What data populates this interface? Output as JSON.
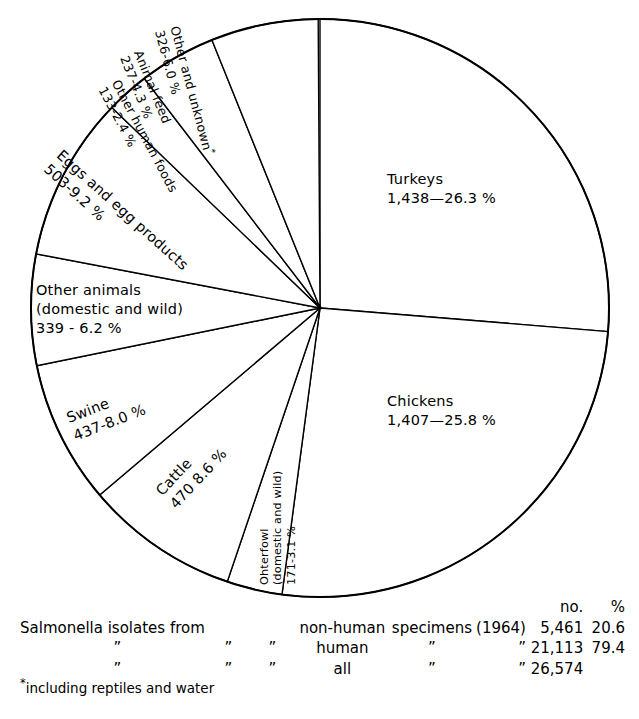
{
  "chart_data": {
    "type": "pie",
    "title": "",
    "start_angle_deg": 0,
    "direction": "clockwise",
    "total_no": 5461,
    "units": "isolates",
    "categories": [
      "Turkeys",
      "Chickens",
      "Ohterfowl (domestic and wild)",
      "Cattle",
      "Swine",
      "Other animals (domestic and wild)",
      "Eggs and egg products",
      "Other human foods",
      "Animal feed",
      "Other and unknown"
    ],
    "values": [
      26.3,
      25.8,
      3.1,
      8.6,
      8.0,
      6.2,
      9.2,
      2.4,
      4.3,
      6.0
    ],
    "counts": [
      1438,
      1407,
      171,
      470,
      437,
      339,
      503,
      133,
      237,
      326
    ],
    "slices": [
      {
        "name": "Turkeys",
        "label_l1": "Turkeys",
        "label_l2": "1,438—26.3 %",
        "count": "1,438",
        "percent": "26.3 %",
        "value": 26.3
      },
      {
        "name": "Chickens",
        "label_l1": "Chickens",
        "label_l2": "1,407—25.8 %",
        "count": "1,407",
        "percent": "25.8 %",
        "value": 25.8
      },
      {
        "name": "Other fowl",
        "label_l1": "Ohterfowl",
        "label_l2": "(domestic and wild)",
        "label_l3": "171—3.1 %",
        "count": "171",
        "percent": "3.1 %",
        "value": 3.1
      },
      {
        "name": "Cattle",
        "label_l1": "Cattle",
        "label_l2": "470  8.6 %",
        "count": "470",
        "percent": "8.6 %",
        "value": 8.6
      },
      {
        "name": "Swine",
        "label_l1": "Swine",
        "label_l2": "437-8.0 %",
        "count": "437",
        "percent": "8.0 %",
        "value": 8.0
      },
      {
        "name": "Other animals",
        "label_l1": "Other animals",
        "label_l2": "(domestic and wild)",
        "label_l3": "339 - 6.2 %",
        "count": "339",
        "percent": "6.2 %",
        "value": 6.2
      },
      {
        "name": "Eggs and egg products",
        "label_l1": "Eggs and egg products",
        "label_l2": "503-9.2 %",
        "count": "503",
        "percent": "9.2 %",
        "value": 9.2
      },
      {
        "name": "Other human foods",
        "label_l1": "Other human foods",
        "label_l2": "133-2.4 %",
        "count": "133",
        "percent": "2.4 %",
        "value": 2.4
      },
      {
        "name": "Animal feed",
        "label_l1": "Animal feed",
        "label_l2": "237-4.3 %",
        "count": "237",
        "percent": "4.3 %",
        "value": 4.3
      },
      {
        "name": "Other and unknown",
        "label_l1": "Other and unknown",
        "label_l2": "326-6.0 %",
        "count": "326",
        "percent": "6.0 %",
        "value": 6.0,
        "footnote_marker": "*"
      }
    ]
  },
  "labels": {
    "turkeys_l1": "Turkeys",
    "turkeys_l2": "1,438—26.3 %",
    "chickens_l1": "Chickens",
    "chickens_l2": "1,407—25.8 %",
    "other_unknown_l1": "Other and unknown",
    "other_unknown_l2": "326-6.0 %",
    "animal_feed_l1": "Animal feed",
    "animal_feed_l2": "237-4.3 %",
    "other_human_foods_l1": "Other human foods",
    "other_human_foods_l2": "133-2.4 %",
    "eggs_l1": "Eggs  and  egg  products",
    "eggs_l2": "503-9.2 %",
    "other_animals_l1": "Other animals",
    "other_animals_l2": "(domestic and wild)",
    "other_animals_l3": "339 - 6.2 %",
    "swine_l1": "Swine",
    "swine_l2": "437-8.0 %",
    "cattle_l1": "Cattle",
    "cattle_l2": "470  8.6 %",
    "other_fowl_l1": "Ohterfowl",
    "other_fowl_l2": "(domestic and wild)",
    "other_fowl_l3": "171-3.1 %"
  },
  "caption": {
    "header": {
      "no": "no.",
      "pct": "%"
    },
    "rows": [
      {
        "lead": "Salmonella  isolates  from",
        "kind": "non-human",
        "spec": "specimens",
        "year": "(1964)",
        "no": "5,461",
        "pct": "20.6"
      },
      {
        "dq1": "”",
        "dq2": "”",
        "dq3": "”",
        "kind": "human",
        "spec": "”",
        "year": "”",
        "no": "21,113",
        "pct": "79.4"
      },
      {
        "dq1": "”",
        "dq2": "”",
        "dq3": "”",
        "kind": "all",
        "spec": "”",
        "year": "”",
        "no": "26,574",
        "pct": ""
      }
    ]
  },
  "footnote": {
    "marker": "*",
    "text": "including  reptiles  and  water"
  }
}
